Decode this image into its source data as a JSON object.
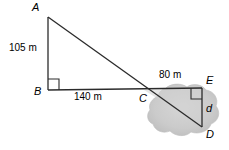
{
  "figure": {
    "vertices": [
      {
        "id": "A",
        "label": "A",
        "x": 48,
        "y": 16
      },
      {
        "id": "B",
        "label": "B",
        "x": 48,
        "y": 90
      },
      {
        "id": "C",
        "label": "C",
        "x": 144,
        "y": 90
      },
      {
        "id": "E",
        "label": "E",
        "x": 202,
        "y": 88
      },
      {
        "id": "D",
        "label": "D",
        "x": 202,
        "y": 127
      }
    ],
    "measurements": [
      {
        "id": "AB",
        "label": "105 m",
        "value": 105,
        "unit": "m"
      },
      {
        "id": "BC",
        "label": "140 m",
        "value": 140,
        "unit": "m"
      },
      {
        "id": "CE",
        "label": "80 m",
        "value": 80,
        "unit": "m"
      },
      {
        "id": "ED",
        "label": "d",
        "value": null,
        "unit": "m"
      }
    ],
    "right_angles": [
      "B",
      "E"
    ],
    "shading": {
      "name": "pond",
      "color": "#c9c9c9"
    },
    "stroke_color": "#2b2b2b"
  }
}
